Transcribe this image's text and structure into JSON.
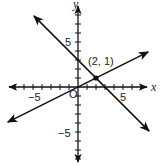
{
  "chart_data": {
    "type": "line",
    "title": "",
    "xlabel": "x",
    "ylabel": "y",
    "xlim": [
      -8,
      8
    ],
    "ylim": [
      -8.5,
      9
    ],
    "grid": false,
    "tick_step": 1,
    "tick_labels": {
      "x": [
        "-5",
        "5"
      ],
      "y": [
        "5",
        "-5"
      ],
      "origin": "O"
    },
    "series": [
      {
        "name": "line-1",
        "equation": "y = -x + 3",
        "slope": -1,
        "intercept": 3,
        "x_range": [
          -4.9,
          7.9
        ],
        "arrows": "both"
      },
      {
        "name": "line-2",
        "equation": "y = x/2",
        "slope": 0.5,
        "intercept": 0,
        "x_range": [
          -7.8,
          7.8
        ],
        "arrows": "both"
      }
    ],
    "points": [
      {
        "x": 2,
        "y": 1,
        "label": "(2, 1)"
      }
    ],
    "annotations": [
      "(2, 1)"
    ]
  },
  "labels": {
    "x_axis": "x",
    "y_axis": "y",
    "x_neg5": "−5",
    "x_pos5": "5",
    "y_pos5": "5",
    "y_neg5": "−5",
    "origin": "O",
    "intersection": "(2, 1)"
  }
}
